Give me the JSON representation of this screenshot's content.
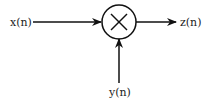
{
  "diagram": {
    "type": "multiplier-block",
    "inputs": [
      {
        "id": "x",
        "label": "x(n)"
      },
      {
        "id": "y",
        "label": "y(n)"
      }
    ],
    "operator": {
      "symbol": "×",
      "name": "multiply"
    },
    "output": {
      "id": "z",
      "label": "z(n)"
    },
    "edges": [
      {
        "from": "x(n)",
        "to": "multiply"
      },
      {
        "from": "y(n)",
        "to": "multiply"
      },
      {
        "from": "multiply",
        "to": "z(n)"
      }
    ]
  }
}
